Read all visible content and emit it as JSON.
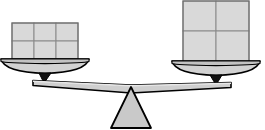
{
  "figure": {
    "width": 265,
    "height": 130,
    "background_color": "#ffffff"
  },
  "colors": {
    "block_fill": "#d9d9d9",
    "block_stroke": "#808080",
    "pan_fill": "#d0d0d0",
    "pan_stroke": "#000000",
    "beam_fill": "#cccccc",
    "beam_stroke": "#000000",
    "fulcrum_fill": "#c8c8c8",
    "fulcrum_stroke": "#000000",
    "pivot_fill": "#000000"
  },
  "left_side": {
    "label": "left-pan-assembly",
    "block_group": {
      "label": "left-block-group",
      "columns": 3,
      "rows": 2,
      "count": 6,
      "block_width": 22,
      "block_height": 18,
      "x": 12,
      "y": 23,
      "total_width": 66,
      "total_height": 36
    },
    "pan": {
      "label": "left-pan",
      "center_x": 45,
      "top_y": 59,
      "width": 90,
      "depth": 14
    },
    "pivot": {
      "label": "left-pivot",
      "center_x": 45,
      "y": 73,
      "width": 12,
      "height": 10
    }
  },
  "right_side": {
    "label": "right-pan-assembly",
    "block_group": {
      "label": "right-block-group",
      "columns": 2,
      "rows": 2,
      "count": 4,
      "block_width": 33,
      "block_height": 31,
      "x": 183,
      "y": 1,
      "total_width": 66,
      "total_height": 62
    },
    "pan": {
      "label": "right-pan",
      "center_x": 216,
      "top_y": 61,
      "width": 90,
      "depth": 14
    },
    "pivot": {
      "label": "right-pivot",
      "center_x": 216,
      "y": 74,
      "width": 12,
      "height": 10
    }
  },
  "beam": {
    "label": "balance-beam",
    "left_x": 38,
    "left_y": 81,
    "right_x": 224,
    "right_y": 83,
    "center_x": 131,
    "center_y": 86,
    "thickness": 7
  },
  "fulcrum": {
    "label": "fulcrum-triangle",
    "apex_x": 131,
    "apex_y": 86,
    "base_left_x": 112,
    "base_right_x": 150,
    "base_y": 127
  }
}
